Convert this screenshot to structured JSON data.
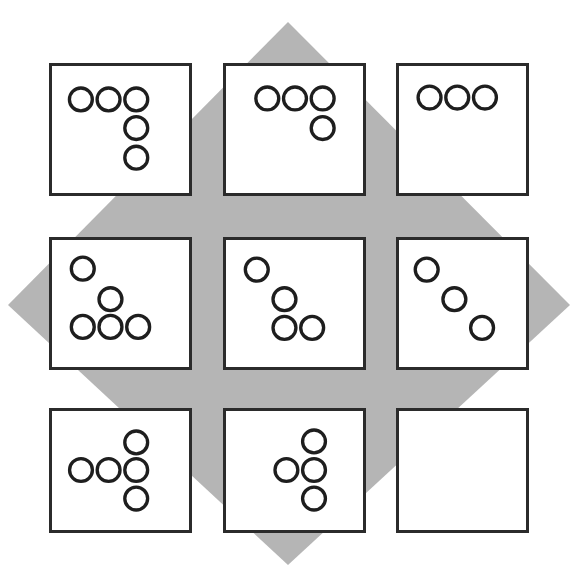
{
  "figure": {
    "type": "matrix-reasoning-item",
    "canvas": {
      "width": 576,
      "height": 576,
      "background": "#ffffff"
    },
    "colors": {
      "background": "#ffffff",
      "diamond_fill": "#b5b5b5",
      "cell_border": "#2b2b2b",
      "cell_fill": "#ffffff",
      "circle_stroke": "#1e1e1e"
    },
    "diamond": {
      "name": "gray-diamond-background",
      "points": "288,22 570,305 288,565 8,305",
      "fill": "#b5b5b5"
    },
    "geometry": {
      "cell_width": 143,
      "cell_height": 133,
      "col_x": [
        49,
        223,
        396
      ],
      "row_y": [
        63,
        237,
        408
      ],
      "circle_radius": 12,
      "circle_stroke_width": 3.5
    },
    "grid": {
      "rows": 3,
      "cols": 3,
      "cells": [
        {
          "id": "cell-r1c1",
          "row": 1,
          "col": 1,
          "x": 49,
          "y": 63,
          "width": 143,
          "height": 133,
          "circle_count": 5,
          "shape_label": "three-across-with-two-down-right",
          "circles": [
            {
              "cx": 30,
              "cy": 35
            },
            {
              "cx": 59,
              "cy": 35
            },
            {
              "cx": 88,
              "cy": 35
            },
            {
              "cx": 88,
              "cy": 65
            },
            {
              "cx": 88,
              "cy": 96
            }
          ]
        },
        {
          "id": "cell-r1c2",
          "row": 1,
          "col": 2,
          "x": 223,
          "y": 63,
          "width": 143,
          "height": 133,
          "circle_count": 4,
          "shape_label": "three-across-with-one-down-right",
          "circles": [
            {
              "cx": 43,
              "cy": 34
            },
            {
              "cx": 72,
              "cy": 34
            },
            {
              "cx": 101,
              "cy": 34
            },
            {
              "cx": 101,
              "cy": 65
            }
          ]
        },
        {
          "id": "cell-r1c3",
          "row": 1,
          "col": 3,
          "x": 396,
          "y": 63,
          "width": 133,
          "height": 133,
          "circle_count": 3,
          "shape_label": "three-across",
          "circles": [
            {
              "cx": 32,
              "cy": 33
            },
            {
              "cx": 61,
              "cy": 33
            },
            {
              "cx": 90,
              "cy": 33
            }
          ]
        },
        {
          "id": "cell-r2c1",
          "row": 2,
          "col": 1,
          "x": 49,
          "y": 237,
          "width": 143,
          "height": 133,
          "circle_count": 5,
          "shape_label": "diagonal-two-with-three-across-bottom",
          "circles": [
            {
              "cx": 32,
              "cy": 30
            },
            {
              "cx": 61,
              "cy": 62
            },
            {
              "cx": 32,
              "cy": 91
            },
            {
              "cx": 61,
              "cy": 91
            },
            {
              "cx": 90,
              "cy": 91
            }
          ]
        },
        {
          "id": "cell-r2c2",
          "row": 2,
          "col": 2,
          "x": 223,
          "y": 237,
          "width": 143,
          "height": 133,
          "circle_count": 4,
          "shape_label": "diagonal-two-with-two-across-bottom",
          "circles": [
            {
              "cx": 32,
              "cy": 31
            },
            {
              "cx": 61,
              "cy": 62
            },
            {
              "cx": 61,
              "cy": 92
            },
            {
              "cx": 90,
              "cy": 92
            }
          ]
        },
        {
          "id": "cell-r2c3",
          "row": 2,
          "col": 3,
          "x": 396,
          "y": 237,
          "width": 133,
          "height": 133,
          "circle_count": 3,
          "shape_label": "diagonal-three",
          "circles": [
            {
              "cx": 29,
              "cy": 31
            },
            {
              "cx": 58,
              "cy": 62
            },
            {
              "cx": 87,
              "cy": 92
            }
          ]
        },
        {
          "id": "cell-r3c1",
          "row": 3,
          "col": 1,
          "x": 49,
          "y": 408,
          "width": 143,
          "height": 125,
          "circle_count": 5,
          "shape_label": "three-across-with-one-up-and-one-down-right",
          "circles": [
            {
              "cx": 88,
              "cy": 33
            },
            {
              "cx": 30,
              "cy": 62
            },
            {
              "cx": 59,
              "cy": 62
            },
            {
              "cx": 88,
              "cy": 62
            },
            {
              "cx": 88,
              "cy": 92
            }
          ]
        },
        {
          "id": "cell-r3c2",
          "row": 3,
          "col": 2,
          "x": 223,
          "y": 408,
          "width": 143,
          "height": 125,
          "circle_count": 4,
          "shape_label": "three-down-with-one-left-of-middle",
          "circles": [
            {
              "cx": 92,
              "cy": 32
            },
            {
              "cx": 63,
              "cy": 62
            },
            {
              "cx": 92,
              "cy": 62
            },
            {
              "cx": 92,
              "cy": 92
            }
          ]
        },
        {
          "id": "cell-r3c3",
          "row": 3,
          "col": 3,
          "x": 396,
          "y": 408,
          "width": 133,
          "height": 125,
          "circle_count": 0,
          "shape_label": "empty-answer-cell",
          "circles": []
        }
      ]
    }
  }
}
